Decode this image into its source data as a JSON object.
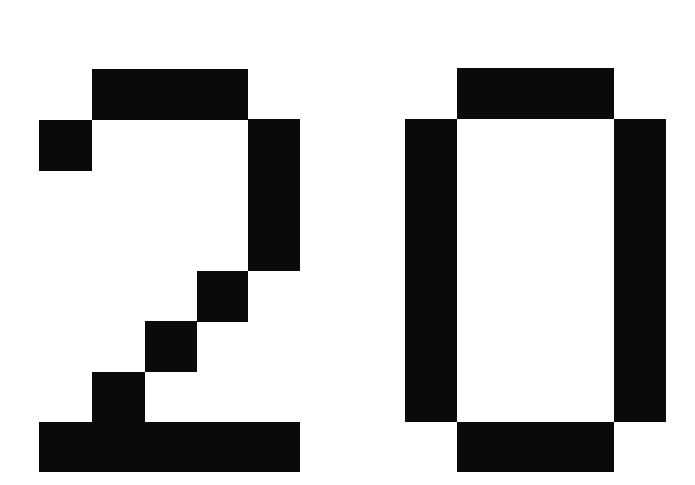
{
  "display": {
    "text": "20",
    "foreground_color": "#0a0a0a",
    "background_color": "#ffffff",
    "digits": [
      {
        "char": "2",
        "blocks": [
          {
            "x": 92,
            "y": 69,
            "w": 156,
            "h": 51
          },
          {
            "x": 39,
            "y": 120,
            "w": 53,
            "h": 51
          },
          {
            "x": 248,
            "y": 119,
            "w": 52,
            "h": 152
          },
          {
            "x": 197,
            "y": 271,
            "w": 51,
            "h": 51
          },
          {
            "x": 145,
            "y": 321,
            "w": 52,
            "h": 51
          },
          {
            "x": 92,
            "y": 372,
            "w": 53,
            "h": 51
          },
          {
            "x": 39,
            "y": 422,
            "w": 261,
            "h": 50
          }
        ]
      },
      {
        "char": "0",
        "blocks": [
          {
            "x": 457,
            "y": 68,
            "w": 157,
            "h": 51
          },
          {
            "x": 405,
            "y": 119,
            "w": 52,
            "h": 303
          },
          {
            "x": 614,
            "y": 119,
            "w": 52,
            "h": 303
          },
          {
            "x": 457,
            "y": 422,
            "w": 157,
            "h": 50
          }
        ]
      }
    ]
  }
}
